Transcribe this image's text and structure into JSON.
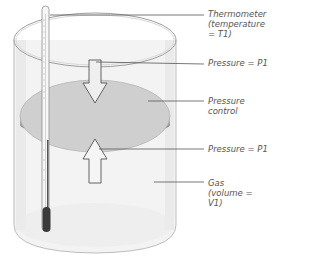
{
  "diagram": {
    "labels": {
      "thermometer": "Thermometer\n(temperature\n= T1)",
      "pressure_top": "Pressure = P1",
      "pressure_control": "Pressure\ncontrol",
      "pressure_bottom": "Pressure = P1",
      "gas": "Gas\n(volume = V1)"
    },
    "colors": {
      "piston_top": "#c8c8c8",
      "piston_edge": "#9a9a9a",
      "glass": "#e8e8e8",
      "outline": "#999999",
      "thermometer_bulb": "#333333",
      "leader_line": "#555555"
    }
  }
}
